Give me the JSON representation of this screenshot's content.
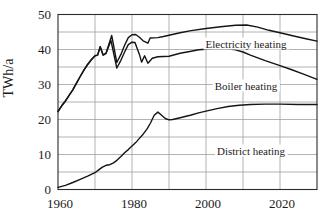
{
  "chart_data": {
    "type": "line",
    "title": "",
    "xlabel": "",
    "ylabel": "TWh/a",
    "xlim": [
      1960,
      2030
    ],
    "ylim": [
      0,
      50
    ],
    "x_tick_labels": [
      "1960",
      "1980",
      "2000",
      "2020"
    ],
    "x_tick_years": [
      1960,
      1980,
      2000,
      2020
    ],
    "x_gridline_years": [
      1970,
      1980,
      1990,
      2000,
      2010,
      2020
    ],
    "y_tick_labels": [
      "0",
      "10",
      "20",
      "30",
      "40",
      "50"
    ],
    "y_tick_values": [
      0,
      10,
      20,
      30,
      40,
      50
    ],
    "y_gridline_values": [
      5,
      10,
      15,
      20,
      25,
      30,
      35,
      40,
      45
    ],
    "grid": true,
    "legend_position": "inline-labels",
    "colors": {
      "line": "#151515",
      "grid": "#a0a0a0",
      "frame": "#2b2b2b",
      "background": "#ffffff",
      "text": "#1c1c1c"
    },
    "series": [
      {
        "name": "Electricity heating",
        "label_pos": {
          "x": 246,
          "y": 45
        },
        "points": [
          [
            1960,
            22.3
          ],
          [
            1961,
            23.9
          ],
          [
            1962,
            25.3
          ],
          [
            1963,
            26.9
          ],
          [
            1964,
            28.5
          ],
          [
            1965,
            30.4
          ],
          [
            1966,
            32.3
          ],
          [
            1967,
            34.1
          ],
          [
            1968,
            35.7
          ],
          [
            1969,
            37.1
          ],
          [
            1970,
            38.2
          ],
          [
            1970.7,
            38.4
          ],
          [
            1971.4,
            40.8
          ],
          [
            1972.2,
            38.4
          ],
          [
            1973,
            39.0
          ],
          [
            1974.5,
            44.0
          ],
          [
            1975.9,
            36.3
          ],
          [
            1977,
            38.6
          ],
          [
            1978,
            41.2
          ],
          [
            1979,
            43.4
          ],
          [
            1980,
            44.2
          ],
          [
            1981,
            44.3
          ],
          [
            1982,
            43.5
          ],
          [
            1983,
            42.5
          ],
          [
            1984.3,
            41.8
          ],
          [
            1984.9,
            43.3
          ],
          [
            1987,
            43.4
          ],
          [
            1988.5,
            43.7
          ],
          [
            1990,
            44.1
          ],
          [
            1993,
            44.8
          ],
          [
            1996,
            45.4
          ],
          [
            2000,
            46.0
          ],
          [
            2004,
            46.5
          ],
          [
            2008,
            46.9
          ],
          [
            2011,
            47.0
          ],
          [
            2014,
            46.4
          ],
          [
            2017,
            45.5
          ],
          [
            2020,
            44.8
          ],
          [
            2024,
            43.8
          ],
          [
            2027,
            43.1
          ],
          [
            2030,
            42.4
          ]
        ]
      },
      {
        "name": "Boiler heating",
        "label_pos": {
          "x": 246,
          "y": 87
        },
        "points": [
          [
            1960,
            22.3
          ],
          [
            1961,
            23.9
          ],
          [
            1962,
            25.3
          ],
          [
            1963,
            26.9
          ],
          [
            1964,
            28.5
          ],
          [
            1965,
            30.4
          ],
          [
            1966,
            32.3
          ],
          [
            1967,
            34.1
          ],
          [
            1968,
            35.7
          ],
          [
            1969,
            37.1
          ],
          [
            1970,
            38.2
          ],
          [
            1970.7,
            38.4
          ],
          [
            1971.4,
            40.8
          ],
          [
            1972.2,
            38.4
          ],
          [
            1973,
            38.9
          ],
          [
            1974.3,
            42.6
          ],
          [
            1975.9,
            34.7
          ],
          [
            1977,
            36.9
          ],
          [
            1978,
            39.3
          ],
          [
            1979,
            41.4
          ],
          [
            1980,
            42.1
          ],
          [
            1980.8,
            42.0
          ],
          [
            1982,
            38.6
          ],
          [
            1982.6,
            36.4
          ],
          [
            1983.4,
            38.2
          ],
          [
            1984.3,
            36.1
          ],
          [
            1985.5,
            37.5
          ],
          [
            1987,
            37.9
          ],
          [
            1990,
            38.1
          ],
          [
            1993,
            38.9
          ],
          [
            1996,
            39.5
          ],
          [
            1998,
            39.9
          ],
          [
            2000,
            40.1
          ],
          [
            2002,
            40.2
          ],
          [
            2004,
            40.3
          ],
          [
            2006,
            40.2
          ],
          [
            2008,
            39.9
          ],
          [
            2010,
            39.3
          ],
          [
            2012,
            38.4
          ],
          [
            2014,
            37.6
          ],
          [
            2016,
            36.8
          ],
          [
            2018,
            36.1
          ],
          [
            2020,
            35.4
          ],
          [
            2023,
            34.3
          ],
          [
            2026,
            33.1
          ],
          [
            2030,
            31.5
          ]
        ]
      },
      {
        "name": "District heating",
        "label_pos": {
          "x": 251,
          "y": 152
        },
        "points": [
          [
            1960,
            0.6
          ],
          [
            1962,
            1.2
          ],
          [
            1964,
            2.0
          ],
          [
            1966,
            2.9
          ],
          [
            1968,
            3.8
          ],
          [
            1970,
            4.8
          ],
          [
            1971,
            5.6
          ],
          [
            1972,
            6.4
          ],
          [
            1973,
            6.9
          ],
          [
            1974,
            7.1
          ],
          [
            1975,
            7.6
          ],
          [
            1976,
            8.4
          ],
          [
            1977,
            9.4
          ],
          [
            1978,
            10.5
          ],
          [
            1979,
            11.4
          ],
          [
            1980,
            12.4
          ],
          [
            1981,
            13.4
          ],
          [
            1982,
            14.6
          ],
          [
            1983,
            15.8
          ],
          [
            1984,
            17.2
          ],
          [
            1985,
            19.0
          ],
          [
            1986,
            21.2
          ],
          [
            1987,
            22.1
          ],
          [
            1988,
            21.2
          ],
          [
            1989,
            20.3
          ],
          [
            1990,
            19.9
          ],
          [
            1991,
            20.0
          ],
          [
            1993,
            20.5
          ],
          [
            1996,
            21.3
          ],
          [
            1998,
            21.9
          ],
          [
            2000,
            22.4
          ],
          [
            2003,
            23.1
          ],
          [
            2006,
            23.7
          ],
          [
            2009,
            24.1
          ],
          [
            2012,
            24.3
          ],
          [
            2016,
            24.4
          ],
          [
            2020,
            24.4
          ],
          [
            2025,
            24.3
          ],
          [
            2030,
            24.3
          ]
        ]
      }
    ]
  }
}
